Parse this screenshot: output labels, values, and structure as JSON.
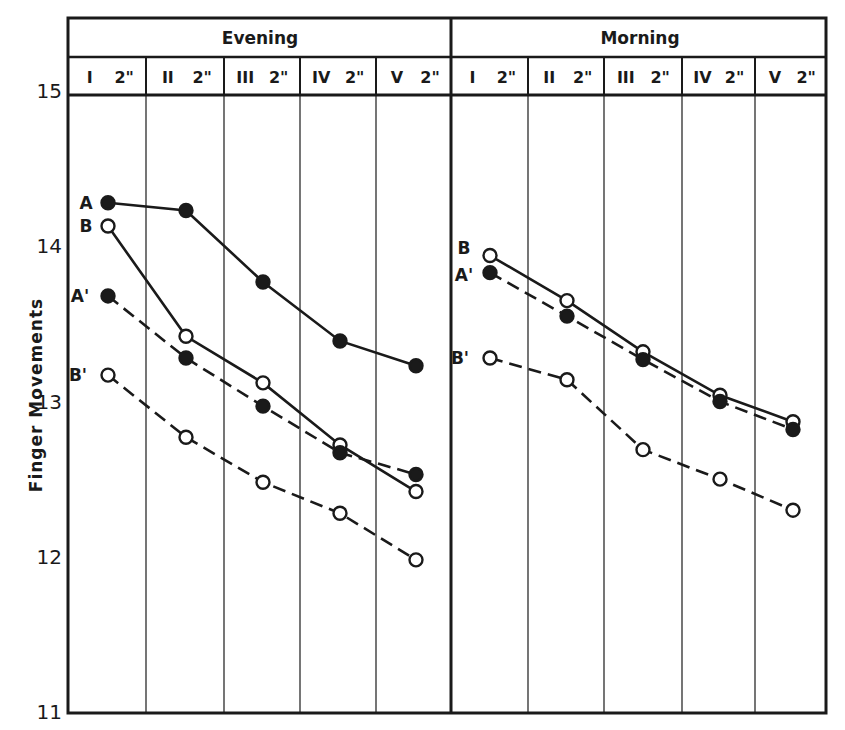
{
  "chart_data": {
    "type": "line",
    "title": "",
    "ylabel": "Finger Movements",
    "xlabel": "",
    "ylim": [
      11,
      15
    ],
    "yticks": [
      11,
      12,
      13,
      14,
      15
    ],
    "grid": "vertical column dividers only",
    "panels": [
      {
        "name": "Evening",
        "categories": [
          "I 2\"",
          "II 2\"",
          "III 2\"",
          "IV 2\"",
          "V 2\""
        ],
        "category_roman": [
          "I",
          "II",
          "III",
          "IV",
          "V"
        ],
        "category_suffix": "2\"",
        "series": [
          {
            "name": "A",
            "marker": "filled",
            "line": "solid",
            "values": [
              14.28,
              14.23,
              13.77,
              13.39,
              13.23
            ]
          },
          {
            "name": "B",
            "marker": "open",
            "line": "solid",
            "values": [
              14.13,
              13.42,
              13.12,
              12.72,
              12.42
            ]
          },
          {
            "name": "A'",
            "marker": "filled",
            "line": "dashed",
            "values": [
              13.68,
              13.28,
              12.97,
              12.67,
              12.53
            ]
          },
          {
            "name": "B'",
            "marker": "open",
            "line": "dashed",
            "values": [
              13.17,
              12.77,
              12.48,
              12.28,
              11.98
            ]
          }
        ]
      },
      {
        "name": "Morning",
        "categories": [
          "I 2\"",
          "II 2\"",
          "III 2\"",
          "IV 2\"",
          "V 2\""
        ],
        "category_roman": [
          "I",
          "II",
          "III",
          "IV",
          "V"
        ],
        "category_suffix": "2\"",
        "series": [
          {
            "name": "B",
            "marker": "open",
            "line": "solid",
            "values": [
              13.94,
              13.65,
              13.32,
              13.04,
              12.87
            ]
          },
          {
            "name": "A'",
            "marker": "filled",
            "line": "dashed",
            "values": [
              13.83,
              13.55,
              13.27,
              13.0,
              12.82
            ]
          },
          {
            "name": "B'",
            "marker": "open",
            "line": "dashed",
            "values": [
              13.28,
              13.14,
              12.69,
              12.5,
              12.3
            ]
          }
        ]
      }
    ]
  },
  "colors": {
    "ink": "#1a1a1a",
    "background": "#ffffff"
  }
}
